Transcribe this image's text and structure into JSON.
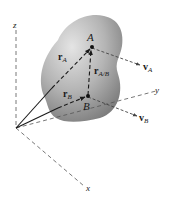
{
  "diagram": {
    "axes": {
      "z": {
        "label": "z"
      },
      "y": {
        "label": "y"
      },
      "x": {
        "label": "x"
      }
    },
    "points": {
      "A": {
        "label": "A"
      },
      "B": {
        "label": "B"
      }
    },
    "vectors": {
      "rA": {
        "main": "r",
        "sub": "A"
      },
      "rB": {
        "main": "r",
        "sub": "B"
      },
      "rAB": {
        "main": "r",
        "sub": "A/B"
      },
      "vA": {
        "main": "v",
        "sub": "A"
      },
      "vB": {
        "main": "v",
        "sub": "B"
      }
    },
    "colors": {
      "body_light": "#d6d6d6",
      "body_dark": "#8a8a8a",
      "line": "#1a1a1a",
      "axis": "#555555"
    }
  }
}
